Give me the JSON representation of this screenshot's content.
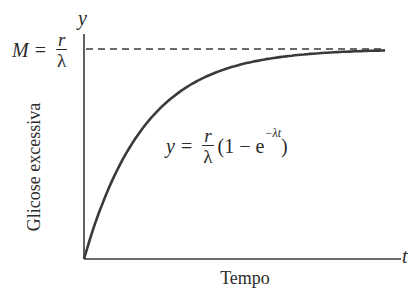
{
  "chart_data": {
    "type": "line",
    "title": "",
    "xlabel": "Tempo",
    "ylabel": "Glicose excessiva",
    "x_axis_symbol": "t",
    "y_axis_symbol": "y",
    "grid": false,
    "legend": null,
    "ticks": {
      "x": [],
      "y": []
    },
    "series": [
      {
        "name": "y = r/λ (1 − e^(−λt))",
        "kind": "exponential-saturation",
        "x": [
          0,
          0.5,
          1,
          1.5,
          2,
          2.5,
          3,
          3.5,
          4,
          5
        ],
        "y": [
          0,
          0.39,
          0.63,
          0.78,
          0.86,
          0.92,
          0.95,
          0.97,
          0.98,
          0.99
        ]
      }
    ],
    "asymptote": {
      "label": "M = r/λ",
      "y": 1.0,
      "style": "dashed"
    },
    "annotations": [
      {
        "text": "M = r/λ",
        "position": "left of y-axis at asymptote"
      },
      {
        "text": "y = r/λ (1 − e^{−λt})",
        "position": "center, below curve"
      }
    ],
    "xlim": [
      0,
      5.2
    ],
    "ylim": [
      0,
      1.05
    ]
  },
  "labels": {
    "y_axis_symbol": "y",
    "x_axis_symbol": "t",
    "x_title": "Tempo",
    "y_title": "Glicose excessiva",
    "m_left": "M",
    "equals": "=",
    "r": "r",
    "lambda": "λ",
    "formula_y": "y",
    "formula_open": "(1 − e",
    "formula_exp": "−λt",
    "formula_close": ")"
  },
  "colors": {
    "ink": "#2b2b2b",
    "curve": "#3a3a3a",
    "background": "#ffffff"
  }
}
